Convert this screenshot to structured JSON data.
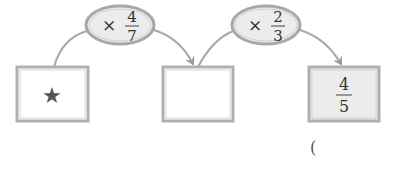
{
  "diagram": {
    "boxes": [
      {
        "id": "start",
        "content": "★",
        "content_type": "symbol",
        "fill": "#ffffff"
      },
      {
        "id": "middle",
        "content": "",
        "content_type": "blank",
        "fill": "#ffffff"
      },
      {
        "id": "result",
        "content_type": "fraction",
        "numerator": "4",
        "denominator": "5",
        "fill": "#ececec"
      }
    ],
    "operations": [
      {
        "operator": "×",
        "numerator": "4",
        "denominator": "7"
      },
      {
        "operator": "×",
        "numerator": "2",
        "denominator": "3"
      }
    ],
    "answer_paren": "("
  },
  "colors": {
    "border": "#b0b0b0",
    "ellipse_fill": "#ececec",
    "arrow": "#9a9a9a",
    "star": "#555555",
    "text": "#333333"
  }
}
